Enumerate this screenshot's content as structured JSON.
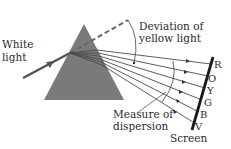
{
  "diagram": {
    "labels": {
      "white_light_line1": "White",
      "white_light_line2": "light",
      "deviation_line1": "Deviation of",
      "deviation_line2": "yellow light",
      "dispersion_line1": "Measure of",
      "dispersion_line2": "dispersion",
      "screen": "Screen"
    },
    "spectrum": [
      "R",
      "O",
      "Y",
      "G",
      "B",
      "V"
    ],
    "colors": {
      "prism": "#777777",
      "rays": "#333333",
      "screen": "#1a1a1a",
      "text": "#2a2a2a"
    }
  }
}
